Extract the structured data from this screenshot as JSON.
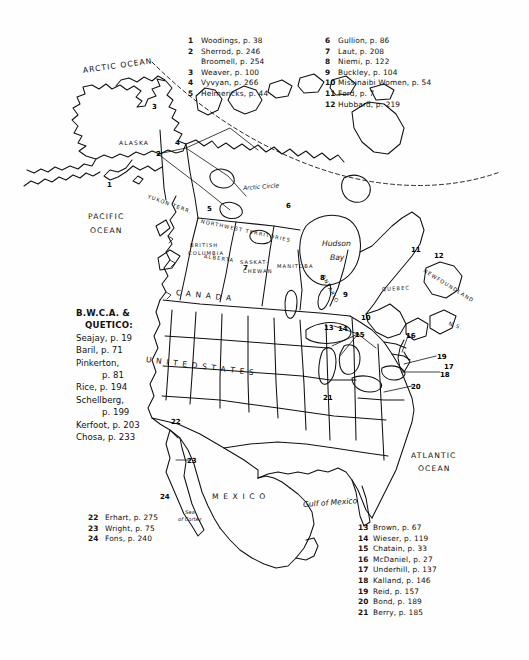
{
  "document": {
    "title": "North America reference map with numbered canoe/wilderness narrative locations",
    "background_color": "#ffffff",
    "ink_color": "#111111"
  },
  "legend_top_left": {
    "entries": [
      {
        "num": "1",
        "text": "Woodings,  p. 38"
      },
      {
        "num": "2",
        "text": "Sherrod,  p. 246"
      },
      {
        "num": "",
        "text": "Broomell, p. 254",
        "continuation": true
      },
      {
        "num": "3",
        "text": "Weaver,  p. 100"
      },
      {
        "num": "4",
        "text": "Vyvyan,  p. 266"
      },
      {
        "num": "5",
        "text": "Helmericks,  p. 44"
      }
    ]
  },
  "legend_top_right": {
    "entries": [
      {
        "num": "6",
        "text": "Gullion,  p. 86"
      },
      {
        "num": "7",
        "text": "Laut,  p. 208"
      },
      {
        "num": "8",
        "text": "Niemi,  p. 122"
      },
      {
        "num": "9",
        "text": "Buckley,  p. 104"
      },
      {
        "num": "10",
        "text": "Missinaibi Women,  p. 54"
      },
      {
        "num": "11",
        "text": "Ford,  p. 7"
      },
      {
        "num": "12",
        "text": "Hubbard,  p. 219"
      }
    ]
  },
  "legend_bottom_right": {
    "entries": [
      {
        "num": "13",
        "text": "Brown,  p. 67"
      },
      {
        "num": "14",
        "text": "Wieser,  p. 119"
      },
      {
        "num": "15",
        "text": "Chatain,  p. 33"
      },
      {
        "num": "16",
        "text": "McDaniel,  p. 27"
      },
      {
        "num": "17",
        "text": "Underhill,  p. 137"
      },
      {
        "num": "18",
        "text": "Kalland,  p. 146"
      },
      {
        "num": "19",
        "text": "Reid,  p. 157"
      },
      {
        "num": "20",
        "text": "Bond,  p. 189"
      },
      {
        "num": "21",
        "text": "Berry,  p. 185"
      }
    ]
  },
  "legend_bottom_left": {
    "entries": [
      {
        "num": "22",
        "text": "Erhart,  p. 275"
      },
      {
        "num": "23",
        "text": "Wright,  p. 75"
      },
      {
        "num": "24",
        "text": "Fons,  p. 240"
      }
    ]
  },
  "bwca_block": {
    "heading_line1": "B.W.C.A. &",
    "heading_line2": "QUETICO:",
    "entries": [
      {
        "text": "Seajay,  p. 19"
      },
      {
        "text": "Baril,  p. 71"
      },
      {
        "text": "Pinkerton,"
      },
      {
        "text": "p. 81",
        "indent": true
      },
      {
        "text": "Rice,  p. 194"
      },
      {
        "text": "Schellberg,"
      },
      {
        "text": "p. 199",
        "indent": true
      },
      {
        "text": "Kerfoot, p. 203"
      },
      {
        "text": "Chosa, p. 233"
      }
    ]
  },
  "map_labels": [
    {
      "name": "arctic-ocean",
      "text": "ARCTIC OCEAN",
      "x": 83,
      "y": 66,
      "size": "md",
      "caps": true,
      "rot": -8
    },
    {
      "name": "pacific-ocean-line1",
      "text": "PACIFIC",
      "x": 88,
      "y": 212,
      "size": "md",
      "caps": true,
      "rot": 0
    },
    {
      "name": "pacific-ocean-line2",
      "text": "OCEAN",
      "x": 90,
      "y": 226,
      "size": "md",
      "caps": true,
      "rot": 0
    },
    {
      "name": "atlantic-ocean-line1",
      "text": "ATLANTIC",
      "x": 411,
      "y": 451,
      "size": "md",
      "caps": true,
      "rot": 0
    },
    {
      "name": "atlantic-ocean-line2",
      "text": "OCEAN",
      "x": 418,
      "y": 464,
      "size": "md",
      "caps": true,
      "rot": 0
    },
    {
      "name": "alaska",
      "text": "ALASKA",
      "x": 119,
      "y": 139,
      "size": "sm",
      "caps": true,
      "rot": 0
    },
    {
      "name": "yukon-territory",
      "text": "YUKON  TERR.",
      "x": 148,
      "y": 193,
      "size": "tiny",
      "caps": true,
      "rot": 20
    },
    {
      "name": "northwest-territories",
      "text": "NORTHWEST  TERRITORIES",
      "x": 201,
      "y": 218,
      "size": "tiny",
      "caps": true,
      "rot": 12
    },
    {
      "name": "british-columbia-1",
      "text": "BRITISH",
      "x": 190,
      "y": 242,
      "size": "tiny",
      "caps": true,
      "rot": 0
    },
    {
      "name": "british-columbia-2",
      "text": "COLUMBIA",
      "x": 188,
      "y": 250,
      "size": "tiny",
      "caps": true,
      "rot": 0
    },
    {
      "name": "alberta",
      "text": "ALBERTA",
      "x": 204,
      "y": 253,
      "size": "tiny",
      "caps": true,
      "rot": 8
    },
    {
      "name": "saskatchewan-1",
      "text": "SASKAT-",
      "x": 240,
      "y": 259,
      "size": "tiny",
      "caps": true,
      "rot": 0
    },
    {
      "name": "saskatchewan-2",
      "text": "CHEWAN",
      "x": 243,
      "y": 268,
      "size": "tiny",
      "caps": true,
      "rot": 0
    },
    {
      "name": "manitoba",
      "text": "MANITOBA",
      "x": 277,
      "y": 263,
      "size": "tiny",
      "caps": true,
      "rot": 0
    },
    {
      "name": "ontario",
      "text": "ONTARIO",
      "x": 323,
      "y": 272,
      "size": "tiny",
      "caps": true,
      "rot": 62
    },
    {
      "name": "quebec",
      "text": "QUEBEC",
      "x": 382,
      "y": 286,
      "size": "tiny",
      "caps": true,
      "rot": -3
    },
    {
      "name": "newfoundland",
      "text": "NEWFOUNDLAND",
      "x": 424,
      "y": 267,
      "size": "tiny",
      "caps": true,
      "rot": 32
    },
    {
      "name": "nova-scotia",
      "text": "N.S.",
      "x": 449,
      "y": 320,
      "size": "tiny",
      "caps": true,
      "rot": 20
    },
    {
      "name": "canada",
      "text": "C  A  N  A  D  A",
      "x": 176,
      "y": 288,
      "size": "md",
      "caps": true,
      "rot": 6
    },
    {
      "name": "united-states",
      "text": "U N I T E D    S T A T E S",
      "x": 146,
      "y": 355,
      "size": "md",
      "caps": true,
      "rot": 7
    },
    {
      "name": "mexico",
      "text": "M E X I C O",
      "x": 212,
      "y": 492,
      "size": "md",
      "caps": true,
      "rot": 0
    },
    {
      "name": "hudson-bay-1",
      "text": "Hudson",
      "x": 322,
      "y": 239,
      "size": "md",
      "caps": false,
      "rot": 0
    },
    {
      "name": "hudson-bay-2",
      "text": "Bay",
      "x": 330,
      "y": 253,
      "size": "md",
      "caps": false,
      "rot": 0
    },
    {
      "name": "gulf-of-mexico",
      "text": "Gulf of Mexico",
      "x": 303,
      "y": 500,
      "size": "md",
      "caps": false,
      "rot": -4
    },
    {
      "name": "sea-of-cortez-1",
      "text": "Sea",
      "x": 185,
      "y": 509,
      "size": "tiny",
      "caps": false,
      "rot": 0
    },
    {
      "name": "sea-of-cortez-2",
      "text": "of Cortez",
      "x": 178,
      "y": 516,
      "size": "tiny",
      "caps": false,
      "rot": 0
    },
    {
      "name": "arctic-circle",
      "text": "Arctic   Circle",
      "x": 243,
      "y": 184,
      "size": "sm",
      "caps": false,
      "rot": -4
    }
  ],
  "map_markers": [
    {
      "num": "1",
      "x": 107,
      "y": 181
    },
    {
      "num": "2",
      "x": 156,
      "y": 150
    },
    {
      "num": "3",
      "x": 152,
      "y": 103
    },
    {
      "num": "4",
      "x": 175,
      "y": 139
    },
    {
      "num": "5",
      "x": 207,
      "y": 205
    },
    {
      "num": "6",
      "x": 286,
      "y": 202
    },
    {
      "num": "7",
      "x": 243,
      "y": 264
    },
    {
      "num": "8",
      "x": 320,
      "y": 274
    },
    {
      "num": "9",
      "x": 343,
      "y": 291
    },
    {
      "num": "10",
      "x": 361,
      "y": 314
    },
    {
      "num": "11",
      "x": 411,
      "y": 246
    },
    {
      "num": "12",
      "x": 434,
      "y": 252
    },
    {
      "num": "13",
      "x": 324,
      "y": 324
    },
    {
      "num": "14",
      "x": 338,
      "y": 325
    },
    {
      "num": "15",
      "x": 355,
      "y": 331
    },
    {
      "num": "16",
      "x": 406,
      "y": 332
    },
    {
      "num": "17",
      "x": 444,
      "y": 363
    },
    {
      "num": "18",
      "x": 440,
      "y": 371
    },
    {
      "num": "19",
      "x": 437,
      "y": 353
    },
    {
      "num": "20",
      "x": 411,
      "y": 383
    },
    {
      "num": "21",
      "x": 323,
      "y": 394
    },
    {
      "num": "22",
      "x": 171,
      "y": 418
    },
    {
      "num": "23",
      "x": 187,
      "y": 457
    },
    {
      "num": "24",
      "x": 160,
      "y": 493
    }
  ]
}
